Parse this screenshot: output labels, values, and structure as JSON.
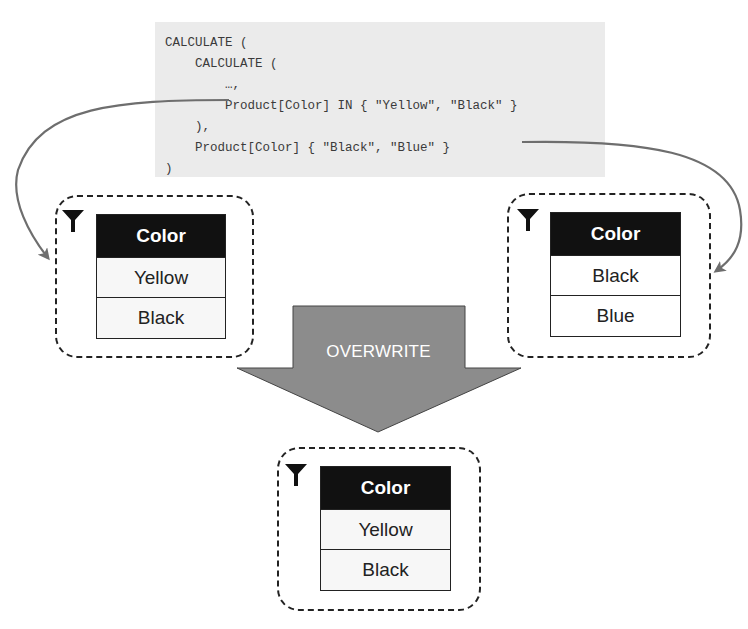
{
  "code": {
    "lines": [
      "CALCULATE (",
      "    CALCULATE (",
      "        …,",
      "        Product[Color] IN { \"Yellow\", \"Black\" }",
      "    ),",
      "    Product[Color] { \"Black\", \"Blue\" }",
      ")"
    ]
  },
  "filters": {
    "inner": {
      "icon": "funnel-icon",
      "header": "Color",
      "rows": [
        "Yellow",
        "Black"
      ]
    },
    "outer": {
      "icon": "funnel-icon",
      "header": "Color",
      "rows": [
        "Black",
        "Blue"
      ]
    },
    "result": {
      "icon": "funnel-icon",
      "header": "Color",
      "rows": [
        "Yellow",
        "Black"
      ]
    }
  },
  "arrow": {
    "label": "OVERWRITE"
  },
  "colors": {
    "code_bg": "#ebebeb",
    "header_bg": "#111111",
    "arrow_fill": "#8c8c8c",
    "connector": "#6e6e6e"
  }
}
